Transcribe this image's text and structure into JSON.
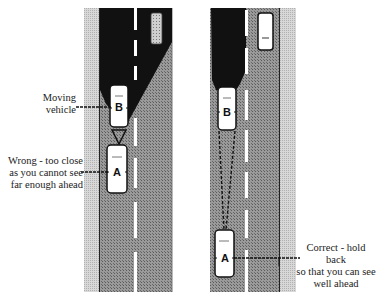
{
  "diagram": {
    "colors": {
      "road": "#8a8a8a",
      "verge": "#cfcfcf",
      "blind_zone": "#111111",
      "lane_marking": "#ffffff",
      "car_body": "#ffffff",
      "car_outline": "#111111",
      "text": "#222222"
    },
    "left_panel": {
      "scenario": "wrong",
      "labels": {
        "moving_vehicle": [
          "Moving",
          "vehicle"
        ],
        "wrong": [
          "Wrong - too close",
          "as you cannot see",
          "far enough ahead"
        ]
      },
      "cars": [
        {
          "id": "top",
          "label": ""
        },
        {
          "id": "B",
          "label": "B"
        },
        {
          "id": "A",
          "label": "A"
        }
      ]
    },
    "right_panel": {
      "scenario": "correct",
      "labels": {
        "correct": [
          "Correct - hold back",
          "so that you can see",
          "well ahead"
        ]
      },
      "cars": [
        {
          "id": "top",
          "label": ""
        },
        {
          "id": "B",
          "label": "B"
        },
        {
          "id": "A",
          "label": "A"
        }
      ]
    }
  }
}
